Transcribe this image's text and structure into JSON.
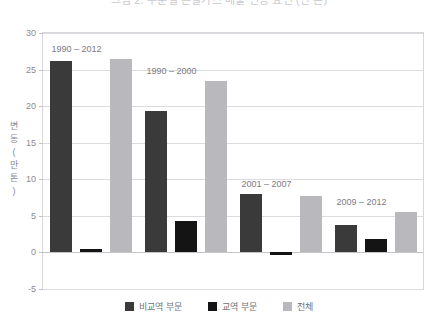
{
  "title": {
    "text": "그림 2. 부문별 온실가스 배출 변동 요인 (만 톤)",
    "clipped": true
  },
  "colors": {
    "series_nontrade": "#3a3a3a",
    "series_trade": "#141414",
    "series_total": "#b9b9bd",
    "gridline": "#dcdce0",
    "zero_line": "#c3c3c8",
    "frame": "#d7d7db",
    "tick_text": "#8a8a90",
    "label_text": "#7c7c82",
    "legend_text": "#6f6f75",
    "background": "#ffffff"
  },
  "y_axis": {
    "caption_chars": [
      "변",
      "동",
      "(",
      "만",
      "톤",
      ")"
    ],
    "caption": "변동 (만 톤)",
    "ticks": [
      "30",
      "25",
      "20",
      "15",
      "10",
      "5",
      "0",
      "-5"
    ]
  },
  "legend": {
    "position": "bottom-center",
    "items": [
      {
        "label": "비교역 부문",
        "color": "#3a3a3a",
        "swatch": "square"
      },
      {
        "label": "교역 부문",
        "color": "#141414",
        "swatch": "square"
      },
      {
        "label": "전체",
        "color": "#b9b9bd",
        "swatch": "square"
      }
    ]
  },
  "group_labels": [
    "1990 – 2012",
    "1990 – 2000",
    "2001 – 2007",
    "2009 – 2012"
  ],
  "chart_data": {
    "type": "bar",
    "title": "그림 2. 부문별 온실가스 배출 변동 요인 (만 톤)",
    "xlabel": "",
    "ylabel": "변동 (만 톤)",
    "ylim": [
      -5,
      30
    ],
    "ytick_step": 5,
    "yticks": [
      -5,
      0,
      5,
      10,
      15,
      20,
      25,
      30
    ],
    "grid": true,
    "legend_position": "bottom-center",
    "categories": [
      "1990 – 2012",
      "1990 – 2000",
      "2001 – 2007",
      "2009 – 2012"
    ],
    "series": [
      {
        "name": "비교역 부문",
        "color": "#3a3a3a",
        "values": [
          26.2,
          19.3,
          8.0,
          3.8
        ]
      },
      {
        "name": "교역 부문",
        "color": "#141414",
        "values": [
          0.5,
          4.3,
          -0.3,
          1.8
        ]
      },
      {
        "name": "전체",
        "color": "#b9b9bd",
        "values": [
          26.4,
          23.5,
          7.7,
          5.5
        ]
      }
    ],
    "annotations": [
      {
        "text": "1990 – 2012",
        "group": 0
      },
      {
        "text": "1990 – 2000",
        "group": 1
      },
      {
        "text": "2001 – 2007",
        "group": 2
      },
      {
        "text": "2009 – 2012",
        "group": 3
      }
    ]
  }
}
